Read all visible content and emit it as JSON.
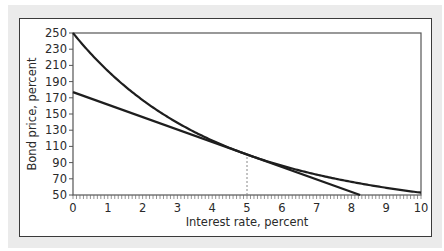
{
  "chart_data": {
    "type": "line",
    "title": "",
    "xlabel": "Interest rate, percent",
    "ylabel": "Bond price, percent",
    "xlim": [
      0,
      10
    ],
    "ylim": [
      50,
      250
    ],
    "x_ticks": [
      0,
      1,
      2,
      3,
      4,
      5,
      6,
      7,
      8,
      9,
      10
    ],
    "x_minor_step": 0.1,
    "y_ticks": [
      50,
      70,
      90,
      110,
      130,
      150,
      170,
      190,
      210,
      230,
      250
    ],
    "grid": false,
    "legend": null,
    "series": [
      {
        "name": "Bond price (30-year, 5% coupon)",
        "style": "curve",
        "x": [
          0,
          1,
          2,
          3,
          4,
          5,
          6,
          7,
          8,
          9,
          10
        ],
        "values": [
          250,
          220.6,
          167.2,
          139.2,
          117.3,
          100,
          86.2,
          75.2,
          66.2,
          58.9,
          52.9
        ]
      },
      {
        "name": "Tangent (duration approximation) at 5%",
        "style": "straight",
        "x": [
          0,
          8.25
        ],
        "values": [
          177,
          50
        ]
      }
    ],
    "annotations": [
      {
        "type": "vertical-dashed-line",
        "x": 5,
        "y_from": 50,
        "y_to": 100
      }
    ]
  }
}
